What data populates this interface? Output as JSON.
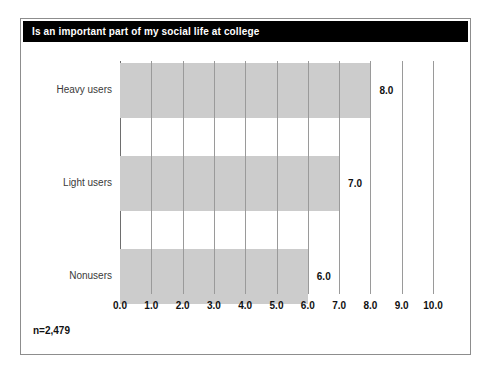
{
  "chart_data": {
    "type": "bar",
    "orientation": "horizontal",
    "title": "Is an important part of my social life at college",
    "categories": [
      "Heavy users",
      "Light users",
      "Nonusers"
    ],
    "values": [
      8.0,
      7.0,
      6.0
    ],
    "value_labels": [
      "8.0",
      "7.0",
      "6.0"
    ],
    "xlabel": "",
    "ylabel": "",
    "xlim": [
      0,
      10
    ],
    "xtick_labels": [
      "0.0",
      "1.0",
      "2.0",
      "3.0",
      "4.0",
      "5.0",
      "6.0",
      "7.0",
      "8.0",
      "9.0",
      "10.0"
    ],
    "xtick_values": [
      0,
      1,
      2,
      3,
      4,
      5,
      6,
      7,
      8,
      9,
      10
    ],
    "grid": "vertical",
    "legend": "none",
    "annotations": [
      "n=2,479"
    ],
    "bar_color": "#cccccc",
    "title_bar_color": "#000000",
    "title_text_color": "#ffffff",
    "gridline_color": "#9a9a9a"
  },
  "footnote": {
    "sample_size": "n=2,479"
  }
}
